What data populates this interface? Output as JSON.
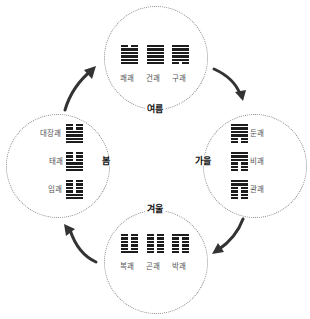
{
  "seasons": {
    "summer": {
      "label": "여름",
      "hexagrams": [
        {
          "name": "쾌괘",
          "lines_top_to_bottom": [
            "yin",
            "yang",
            "yang",
            "yang",
            "yang",
            "yang"
          ]
        },
        {
          "name": "건괘",
          "lines_top_to_bottom": [
            "yang",
            "yang",
            "yang",
            "yang",
            "yang",
            "yang"
          ]
        },
        {
          "name": "구괘",
          "lines_top_to_bottom": [
            "yang",
            "yang",
            "yang",
            "yang",
            "yang",
            "yin"
          ]
        }
      ]
    },
    "autumn": {
      "label": "가을",
      "hexagrams": [
        {
          "name": "둔괘",
          "lines_top_to_bottom": [
            "yang",
            "yang",
            "yang",
            "yang",
            "yin",
            "yin"
          ]
        },
        {
          "name": "비괘",
          "lines_top_to_bottom": [
            "yang",
            "yang",
            "yang",
            "yin",
            "yin",
            "yin"
          ]
        },
        {
          "name": "관괘",
          "lines_top_to_bottom": [
            "yang",
            "yang",
            "yin",
            "yin",
            "yin",
            "yin"
          ]
        }
      ]
    },
    "winter": {
      "label": "겨울",
      "hexagrams": [
        {
          "name": "복괘",
          "lines_top_to_bottom": [
            "yin",
            "yin",
            "yin",
            "yin",
            "yin",
            "yang"
          ]
        },
        {
          "name": "곤괘",
          "lines_top_to_bottom": [
            "yin",
            "yin",
            "yin",
            "yin",
            "yin",
            "yin"
          ]
        },
        {
          "name": "박괘",
          "lines_top_to_bottom": [
            "yang",
            "yin",
            "yin",
            "yin",
            "yin",
            "yin"
          ]
        }
      ]
    },
    "spring": {
      "label": "봄",
      "hexagrams": [
        {
          "name": "대장괘",
          "lines_top_to_bottom": [
            "yin",
            "yin",
            "yang",
            "yang",
            "yang",
            "yang"
          ]
        },
        {
          "name": "태괘",
          "lines_top_to_bottom": [
            "yin",
            "yin",
            "yin",
            "yang",
            "yang",
            "yang"
          ]
        },
        {
          "name": "임괘",
          "lines_top_to_bottom": [
            "yin",
            "yin",
            "yin",
            "yin",
            "yang",
            "yang"
          ]
        }
      ]
    }
  },
  "cycle_order": [
    "spring",
    "summer",
    "autumn",
    "winter"
  ],
  "colors": {
    "ink": "#1c1c1c",
    "circle_border": "#8a8a8a",
    "arrow": "#333333",
    "label": "#555555"
  }
}
